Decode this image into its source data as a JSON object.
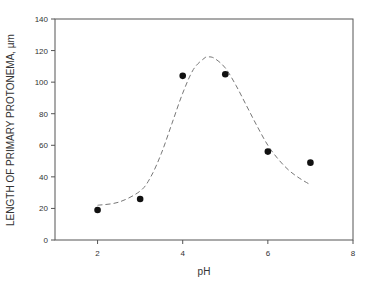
{
  "chart_data": {
    "type": "scatter",
    "title": "",
    "xlabel": "pH",
    "ylabel": "LENGTH OF PRIMARY PROTONEMA, µm",
    "xlim": [
      1,
      8
    ],
    "ylim": [
      0,
      140
    ],
    "xticks": [
      2,
      4,
      6,
      8
    ],
    "yticks": [
      0,
      20,
      40,
      60,
      80,
      100,
      120,
      140
    ],
    "grid": false,
    "legend": null,
    "series": [
      {
        "name": "measured",
        "kind": "scatter",
        "marker": "filled-circle",
        "color": "#111111",
        "x": [
          2,
          3,
          4,
          5,
          6,
          7
        ],
        "y": [
          19,
          26,
          104,
          105,
          56,
          49
        ]
      },
      {
        "name": "fitted-curve",
        "kind": "line",
        "style": "dashed",
        "color": "#777777",
        "x": [
          2.0,
          2.5,
          3.0,
          3.25,
          3.5,
          3.75,
          4.0,
          4.25,
          4.5,
          4.6,
          4.75,
          5.0,
          5.25,
          5.5,
          5.75,
          6.0,
          6.25,
          6.5,
          6.75,
          7.0
        ],
        "y": [
          22,
          24,
          31,
          40,
          55,
          74,
          93,
          108,
          115,
          116,
          115,
          109,
          98,
          85,
          72,
          60,
          51,
          44,
          39,
          35
        ]
      }
    ]
  }
}
